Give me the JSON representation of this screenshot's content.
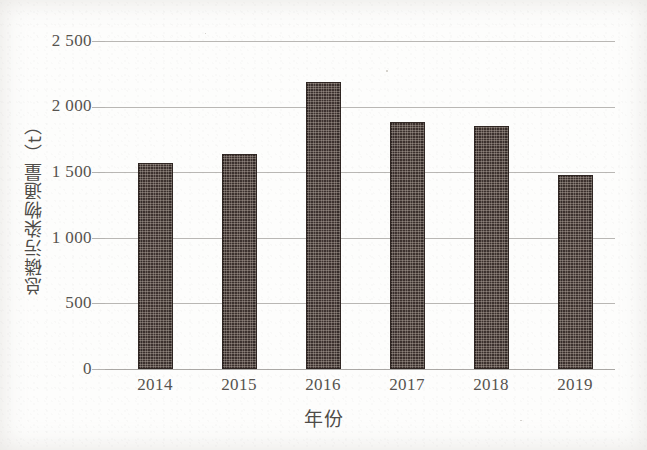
{
  "figure": {
    "background_color": "#fdfdfc",
    "bar_color": "#3c312e",
    "gridline_color": "#b9b7b4",
    "text_color": "#56534f"
  },
  "axes": {
    "y_title": "总磷污染物通量（t）",
    "x_title": "年份",
    "y_ticks": [
      "2 500",
      "2 000",
      "1 500",
      "1 000",
      "500",
      "0"
    ],
    "x_ticks": [
      "2014",
      "2015",
      "2016",
      "2017",
      "2018",
      "2019"
    ]
  },
  "chart_data": {
    "type": "bar",
    "title": "",
    "subtitle": "",
    "xlabel": "年份",
    "ylabel": "总磷污染物通量（t）",
    "categories": [
      "2014",
      "2015",
      "2016",
      "2017",
      "2018",
      "2019"
    ],
    "values": [
      1570,
      1640,
      2185,
      1880,
      1855,
      1480
    ],
    "ylim": [
      0,
      2500
    ],
    "yticks": [
      0,
      500,
      1000,
      1500,
      2000,
      2500
    ],
    "ytick_labels": [
      "0",
      "500",
      "1 000",
      "1 500",
      "2 000",
      "2 500"
    ],
    "grid": true,
    "grid_axis": "y",
    "legend": false,
    "legend_position": "none",
    "series": [
      {
        "name": "总磷污染物通量",
        "values": [
          1570,
          1640,
          2185,
          1880,
          1855,
          1480
        ]
      }
    ],
    "bar_fill": "textured-checker-dark-brown",
    "annotations": []
  }
}
